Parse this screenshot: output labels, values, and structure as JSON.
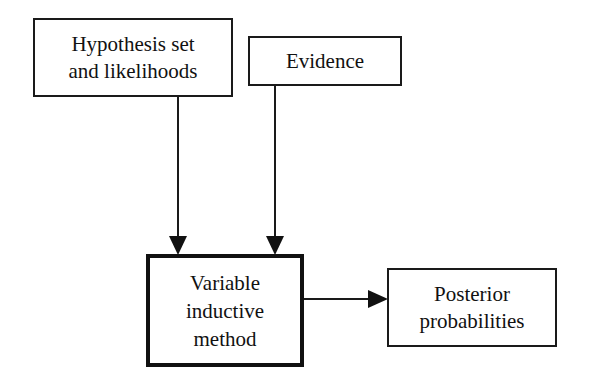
{
  "diagram": {
    "nodes": {
      "hypothesis": {
        "lines": [
          "Hypothesis set",
          "and likelihoods"
        ]
      },
      "evidence": {
        "lines": [
          "Evidence"
        ]
      },
      "method": {
        "lines": [
          "Variable",
          "inductive",
          "method"
        ]
      },
      "posterior": {
        "lines": [
          "Posterior",
          "probabilities"
        ]
      }
    },
    "edges": [
      {
        "from": "hypothesis",
        "to": "method"
      },
      {
        "from": "evidence",
        "to": "method"
      },
      {
        "from": "method",
        "to": "posterior"
      }
    ],
    "colors": {
      "stroke": "#1a1a1a",
      "background": "#ffffff"
    }
  }
}
